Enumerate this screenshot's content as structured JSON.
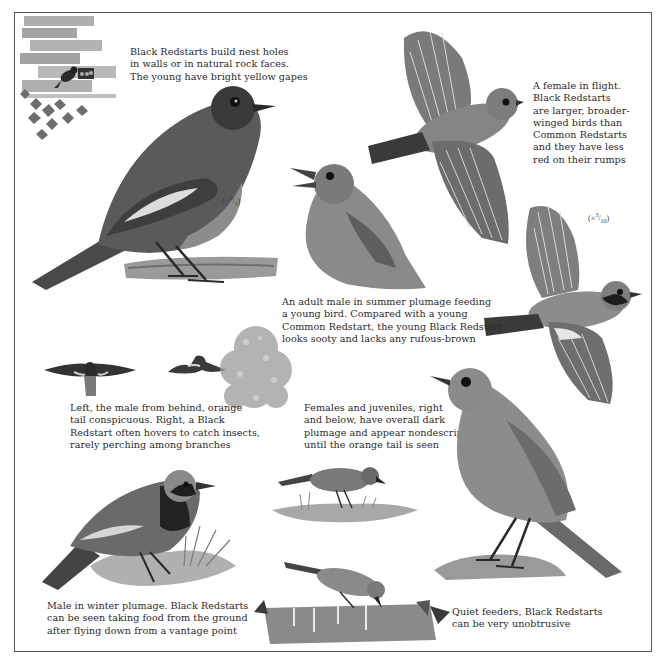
{
  "page": {
    "background": "#ffffff",
    "ink": "#2a2a2a"
  },
  "captions": {
    "nest": "Black Redstarts build nest holes\nin walls or in natural rock faces.\nThe young have bright yellow gapes",
    "female_flight": "A female in flight.\nBlack Redstarts\nare larger, broader-\nwinged birds than\nCommon Redstarts\nand they have less\nred on their rumps",
    "adult_feeding": "An adult male in summer plumage feeding\na young bird. Compared with a young\nCommon Redstart, the young Black Redstart\nlooks sooty and lacks any rufous-brown",
    "male_behind": "Left, the male from behind, orange\ntail conspicuous. Right, a Black\nRedstart often hovers to catch insects,\nrarely perching among branches",
    "females_juveniles": "Females and juveniles, right\nand below, have overall dark\nplumage and appear nondescript\nuntil the orange tail is seen",
    "winter_male": "Male in winter plumage. Black Redstarts\ncan be seen taking food from the ground\nafter flying down from a vantage point",
    "quiet_feeders": "Quiet feeders, Black Redstarts\ncan be very unobtrusive"
  },
  "scales": {
    "large": {
      "prefix": "(×",
      "num": "3",
      "den": "5",
      "suffix": ")"
    },
    "flight": {
      "prefix": "(×",
      "num": "3",
      "den": "10",
      "suffix": ")"
    }
  },
  "illustrations": [
    {
      "id": "wall-nest",
      "label": "Black Redstart at nest hole in brick wall with ivy"
    },
    {
      "id": "adult-male-perched",
      "label": "Adult male in summer plumage on branch"
    },
    {
      "id": "young-bird-begging",
      "label": "Young bird begging, open beak"
    },
    {
      "id": "female-flight-top",
      "label": "Female in flight"
    },
    {
      "id": "male-flight-right",
      "label": "Male in flight"
    },
    {
      "id": "male-from-behind",
      "label": "Male from behind, wings spread"
    },
    {
      "id": "hovering-bird",
      "label": "Black Redstart hovering near foliage"
    },
    {
      "id": "foliage-bush",
      "label": "Foliage bush"
    },
    {
      "id": "female-standing",
      "label": "Female standing on rock"
    },
    {
      "id": "juvenile-ground",
      "label": "Juvenile on grass"
    },
    {
      "id": "winter-male",
      "label": "Male in winter plumage on grass tuft"
    },
    {
      "id": "feeding-log",
      "label": "Bird feeding on log with ivy"
    }
  ]
}
